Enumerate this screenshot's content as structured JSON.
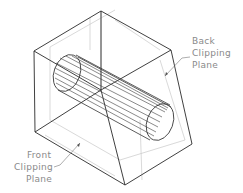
{
  "diagram": {
    "type": "isometric clipping volume illustration",
    "labels": {
      "back_plane": [
        "Back",
        "Clipping",
        "Plane"
      ],
      "front_plane": [
        "Front",
        "Clipping",
        "Plane"
      ]
    },
    "colors": {
      "edge": "#2a2a2a",
      "faint_edge": "#c8c8c8",
      "label": "#8a8a8a",
      "background": "#ffffff"
    }
  }
}
